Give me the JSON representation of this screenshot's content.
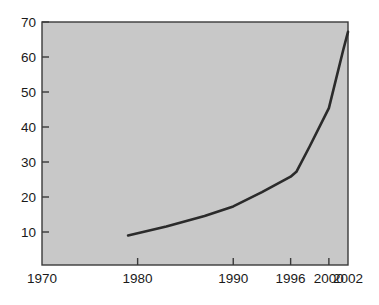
{
  "chart_data": {
    "type": "line",
    "title": "",
    "subtitle": "",
    "xlabel": "",
    "ylabel": "",
    "xlim": [
      1970,
      2002
    ],
    "ylim": [
      0,
      70
    ],
    "grid": false,
    "legend": null,
    "x_ticks": [
      1970,
      1980,
      1990,
      1996,
      2000,
      2002
    ],
    "x_tick_labels": [
      "1970",
      "1980",
      "1990",
      "1996",
      "2000",
      "2002"
    ],
    "y_ticks": [
      10,
      20,
      30,
      40,
      50,
      60,
      70
    ],
    "y_tick_labels": [
      "10",
      "20",
      "30",
      "40",
      "50",
      "60",
      "70"
    ],
    "series": [
      {
        "name": "series-1",
        "color": "#2b2b2b",
        "x": [
          1979,
          1983,
          1987,
          1990,
          1993,
          1996,
          1996.6,
          1998,
          2000,
          2001.5,
          2002
        ],
        "values": [
          9.0,
          11.6,
          14.6,
          17.3,
          21.4,
          25.8,
          27.2,
          34.5,
          45.4,
          62.0,
          67.2
        ]
      }
    ],
    "colors": {
      "plot_background": "#c8c8c8",
      "page_background": "#ffffff",
      "line": "#2b2b2b",
      "axis": "#3a3a3a",
      "tick_text": "#1a1a1a"
    },
    "geometry": {
      "plot_left": 42,
      "plot_right": 348,
      "plot_top": 22,
      "plot_bottom": 265
    }
  }
}
